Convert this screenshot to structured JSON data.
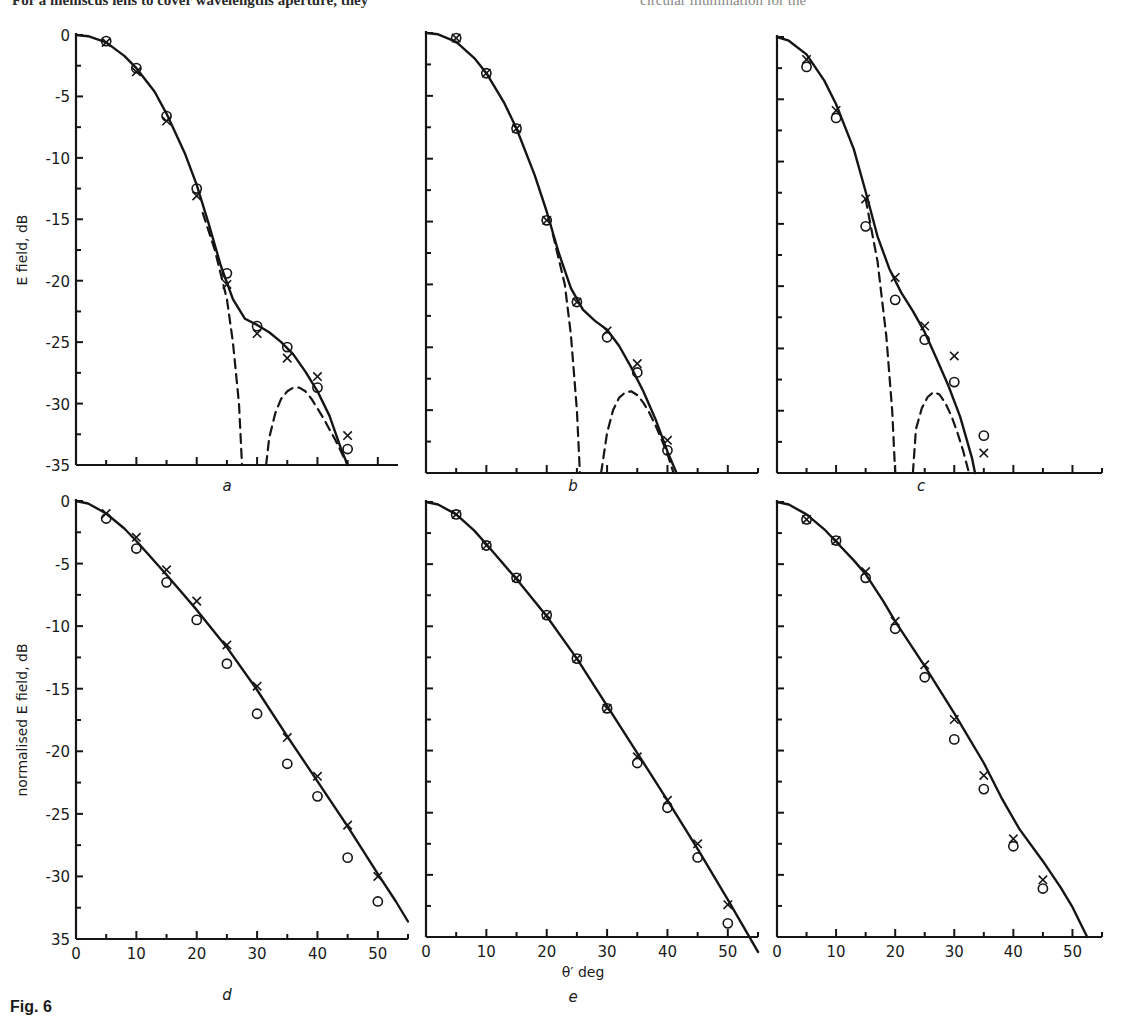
{
  "page": {
    "top_text_left": "For a meniscus lens to cover wavelengths aperture, they",
    "top_text_right": "circular illumination for the",
    "figure_caption": "Fig. 6"
  },
  "chart_data": [
    {
      "panel": "a",
      "type": "scatter",
      "ylabel": "E field, dB",
      "xlabel": "",
      "xlim": [
        0,
        55
      ],
      "ylim": [
        -35,
        0
      ],
      "y_ticks": [
        "0",
        "-5",
        "-10",
        "-15",
        "-20",
        "-25",
        "-30",
        "-35"
      ],
      "x_tick_labels": [],
      "series": [
        {
          "name": "measured (o)",
          "marker": "circle",
          "x": [
            5,
            10,
            15,
            20,
            25,
            30,
            35,
            40,
            45
          ],
          "y": [
            -0.5,
            -2.7,
            -6.6,
            -12.5,
            -19.4,
            -23.7,
            -25.4,
            -28.7,
            -33.7
          ]
        },
        {
          "name": "measured (x)",
          "marker": "cross",
          "x": [
            5,
            10,
            15,
            20,
            25,
            30,
            35,
            40,
            45
          ],
          "y": [
            -0.6,
            -3.0,
            -7.0,
            -13.1,
            -20.3,
            -24.3,
            -26.3,
            -27.8,
            -32.6
          ]
        },
        {
          "name": "theory (solid)",
          "style": "solid",
          "x": [
            0,
            2,
            5,
            8,
            10,
            13,
            15,
            18,
            20,
            22,
            24,
            26,
            28,
            30,
            32,
            34,
            36,
            38,
            40,
            42,
            44,
            45
          ],
          "y": [
            0,
            -0.1,
            -0.6,
            -1.7,
            -2.7,
            -4.6,
            -6.4,
            -9.6,
            -12.2,
            -15.4,
            -18.8,
            -21.5,
            -23.1,
            -23.6,
            -24.2,
            -25.0,
            -26.0,
            -27.4,
            -29.0,
            -31.0,
            -33.8,
            -35
          ]
        },
        {
          "name": "theory (dashed main lobe)",
          "style": "dashed",
          "x": [
            21,
            23,
            25,
            26,
            27,
            27.5
          ],
          "y": [
            -14.5,
            -17.5,
            -21.5,
            -25,
            -30,
            -35
          ]
        },
        {
          "name": "theory (dashed side lobe)",
          "style": "dashed",
          "x": [
            31.5,
            32,
            33,
            34,
            35,
            36,
            37,
            38,
            39,
            40,
            41,
            42,
            43,
            44,
            45
          ],
          "y": [
            -35,
            -32.8,
            -30.8,
            -29.6,
            -29.0,
            -28.7,
            -28.7,
            -29.0,
            -29.6,
            -30.4,
            -31.2,
            -32.1,
            -33.0,
            -34.0,
            -35
          ]
        }
      ]
    },
    {
      "panel": "b",
      "type": "scatter",
      "xlim": [
        0,
        55
      ],
      "ylim": [
        -35,
        0
      ],
      "series": [
        {
          "name": "measured (o)",
          "marker": "circle",
          "x": [
            5,
            10,
            15,
            20,
            25,
            30,
            35,
            40
          ],
          "y": [
            -0.4,
            -3.2,
            -7.6,
            -14.9,
            -21.4,
            -24.2,
            -27.0,
            -33.2
          ]
        },
        {
          "name": "measured (x)",
          "marker": "cross",
          "x": [
            5,
            10,
            15,
            20,
            25,
            30,
            35,
            40
          ],
          "y": [
            -0.4,
            -3.2,
            -7.6,
            -14.9,
            -21.4,
            -23.7,
            -26.3,
            -32.4
          ]
        },
        {
          "name": "theory (solid)",
          "style": "solid",
          "x": [
            0,
            2,
            5,
            8,
            10,
            13,
            15,
            18,
            20,
            22,
            24,
            26,
            28,
            30,
            32,
            34,
            36,
            38,
            40,
            41.5
          ],
          "y": [
            0,
            -0.1,
            -0.7,
            -2.0,
            -3.2,
            -5.6,
            -7.6,
            -11.3,
            -14.2,
            -17.5,
            -20.3,
            -22.0,
            -22.9,
            -23.6,
            -24.9,
            -26.6,
            -28.5,
            -30.7,
            -33.3,
            -35
          ]
        },
        {
          "name": "theory (dashed main lobe)",
          "style": "dashed",
          "x": [
            21,
            23,
            24,
            25,
            25.5
          ],
          "y": [
            -16,
            -20,
            -24,
            -30,
            -35
          ]
        },
        {
          "name": "theory (dashed side lobe)",
          "style": "dashed",
          "x": [
            29,
            30,
            31,
            32,
            33,
            34,
            35,
            36,
            37,
            38,
            39,
            40,
            41
          ],
          "y": [
            -35,
            -31.8,
            -30.0,
            -29.0,
            -28.6,
            -28.5,
            -28.8,
            -29.4,
            -30.2,
            -31.2,
            -32.3,
            -33.5,
            -35
          ]
        }
      ],
      "xlabel": ""
    },
    {
      "panel": "c",
      "type": "scatter",
      "xlim": [
        0,
        55
      ],
      "ylim": [
        -35,
        0
      ],
      "series": [
        {
          "name": "measured (o)",
          "marker": "circle",
          "x": [
            5,
            10,
            15,
            20,
            25,
            30,
            35
          ],
          "y": [
            -2.4,
            -6.5,
            -15.2,
            -21.1,
            -24.3,
            -27.7,
            -32.0
          ]
        },
        {
          "name": "measured (x)",
          "marker": "cross",
          "x": [
            5,
            10,
            15,
            20,
            25,
            30,
            35
          ],
          "y": [
            -1.8,
            -5.9,
            -13.0,
            -19.3,
            -23.2,
            -25.6,
            -33.4
          ]
        },
        {
          "name": "theory (solid)",
          "style": "solid",
          "x": [
            0,
            2,
            5,
            8,
            10,
            13,
            15,
            17,
            19,
            21,
            23,
            25,
            27,
            29,
            31,
            33,
            33.5
          ],
          "y": [
            0,
            -0.3,
            -1.4,
            -3.5,
            -5.4,
            -9.0,
            -12.4,
            -16.0,
            -18.6,
            -20.5,
            -22.0,
            -23.7,
            -25.8,
            -28.0,
            -30.5,
            -33.8,
            -35
          ]
        },
        {
          "name": "theory (dashed main lobe)",
          "style": "dashed",
          "x": [
            15,
            17,
            18.5,
            19.5,
            20
          ],
          "y": [
            -13,
            -18,
            -24,
            -30,
            -35
          ]
        },
        {
          "name": "theory (dashed side lobe)",
          "style": "dashed",
          "x": [
            23,
            23.5,
            24.5,
            25.5,
            26.5,
            27.5,
            28.5,
            29.5,
            30.5,
            31.5,
            32.5
          ],
          "y": [
            -35,
            -31.5,
            -29.8,
            -28.9,
            -28.5,
            -28.7,
            -29.4,
            -30.4,
            -31.7,
            -33.2,
            -35
          ]
        }
      ],
      "xlabel": ""
    },
    {
      "panel": "d",
      "type": "scatter",
      "ylabel": "normalised E field, dB",
      "xlim": [
        0,
        55
      ],
      "ylim": [
        -35,
        0
      ],
      "y_ticks": [
        "0",
        "-5",
        "-10",
        "-15",
        "-20",
        "-25",
        "-30",
        "35"
      ],
      "x_ticks": [
        "0",
        "10",
        "20",
        "30",
        "40",
        "50"
      ],
      "series": [
        {
          "name": "measured (o)",
          "marker": "circle",
          "x": [
            5,
            10,
            15,
            20,
            25,
            30,
            35,
            40,
            45,
            50
          ],
          "y": [
            -1.4,
            -3.8,
            -6.5,
            -9.5,
            -13.0,
            -17.0,
            -21.0,
            -23.6,
            -28.5,
            -32.0
          ]
        },
        {
          "name": "measured (x)",
          "marker": "cross",
          "x": [
            5,
            10,
            15,
            20,
            25,
            30,
            35,
            40,
            45,
            50
          ],
          "y": [
            -1.0,
            -2.9,
            -5.5,
            -8.0,
            -11.5,
            -14.8,
            -18.9,
            -22.0,
            -25.9,
            -30.0
          ]
        },
        {
          "name": "theory (solid)",
          "style": "solid",
          "x": [
            0,
            2,
            5,
            8,
            10,
            15,
            20,
            25,
            30,
            35,
            40,
            45,
            50,
            53,
            55
          ],
          "y": [
            0,
            -0.2,
            -1.0,
            -2.2,
            -3.2,
            -5.9,
            -8.7,
            -11.7,
            -15.1,
            -18.8,
            -22.4,
            -26.0,
            -29.8,
            -32.0,
            -33.6
          ]
        }
      ],
      "xlabel": ""
    },
    {
      "panel": "e",
      "type": "scatter",
      "xlabel": "θ′ deg",
      "xlim": [
        0,
        55
      ],
      "ylim": [
        -35,
        0
      ],
      "x_ticks": [
        "0",
        "10",
        "20",
        "30",
        "40",
        "50"
      ],
      "series": [
        {
          "name": "measured (o)",
          "marker": "circle",
          "x": [
            5,
            10,
            15,
            20,
            25,
            30,
            35,
            40,
            45,
            50
          ],
          "y": [
            -1.0,
            -3.5,
            -6.1,
            -9.1,
            -12.6,
            -16.6,
            -21.0,
            -24.6,
            -28.6,
            -33.9
          ]
        },
        {
          "name": "measured (x)",
          "marker": "cross",
          "x": [
            5,
            10,
            15,
            20,
            25,
            30,
            35,
            40,
            45,
            50
          ],
          "y": [
            -1.0,
            -3.5,
            -6.1,
            -9.1,
            -12.6,
            -16.6,
            -20.5,
            -24.0,
            -27.5,
            -32.4
          ]
        },
        {
          "name": "theory (solid)",
          "style": "solid",
          "x": [
            0,
            2,
            5,
            8,
            10,
            15,
            20,
            25,
            30,
            35,
            40,
            45,
            50,
            55
          ],
          "y": [
            0,
            -0.2,
            -1.0,
            -2.3,
            -3.4,
            -6.2,
            -9.2,
            -12.6,
            -16.4,
            -20.2,
            -24.0,
            -27.9,
            -32.0,
            -36.2
          ]
        }
      ]
    },
    {
      "panel": "f",
      "type": "scatter",
      "xlim": [
        0,
        55
      ],
      "ylim": [
        -35,
        0
      ],
      "x_ticks": [
        "0",
        "10",
        "20",
        "30",
        "40",
        "50"
      ],
      "series": [
        {
          "name": "measured (o)",
          "marker": "circle",
          "x": [
            5,
            10,
            15,
            20,
            25,
            30,
            35,
            40,
            45
          ],
          "y": [
            -1.4,
            -3.1,
            -6.1,
            -10.2,
            -14.1,
            -19.1,
            -23.1,
            -27.7,
            -31.1
          ]
        },
        {
          "name": "measured (x)",
          "marker": "cross",
          "x": [
            5,
            10,
            15,
            20,
            25,
            30,
            35,
            40,
            45
          ],
          "y": [
            -1.4,
            -3.1,
            -5.6,
            -9.6,
            -13.1,
            -17.5,
            -22.0,
            -27.1,
            -30.4
          ]
        },
        {
          "name": "theory (solid)",
          "style": "solid",
          "x": [
            0,
            2,
            5,
            8,
            10,
            13,
            15,
            18,
            20,
            25,
            30,
            35,
            38,
            41,
            45,
            48,
            50,
            52.5
          ],
          "y": [
            0,
            -0.2,
            -1.0,
            -2.2,
            -3.2,
            -4.7,
            -5.8,
            -8.0,
            -9.6,
            -13.2,
            -17.0,
            -21.0,
            -23.8,
            -26.3,
            -28.9,
            -31.0,
            -32.6,
            -35
          ]
        }
      ],
      "xlabel": ""
    }
  ]
}
